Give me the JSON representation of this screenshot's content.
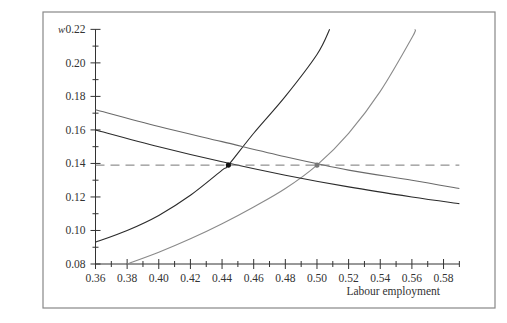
{
  "chart_data": {
    "type": "line",
    "title": "",
    "xlabel": "Labour employment",
    "ylabel": "w",
    "xlim": [
      0.36,
      0.59
    ],
    "ylim": [
      0.08,
      0.22
    ],
    "grid": false,
    "legend": null,
    "x_ticks": [
      "0.36",
      "0.38",
      "0.40",
      "0.42",
      "0.44",
      "0.46",
      "0.48",
      "0.50",
      "0.52",
      "0.54",
      "0.56",
      "0.58"
    ],
    "y_ticks": [
      "0.08",
      "0.10",
      "0.12",
      "0.14",
      "0.16",
      "0.18",
      "0.20",
      "0.22"
    ],
    "series": [
      {
        "name": "rising-curve-dark",
        "color": "#2b2b2b",
        "x": [
          0.36,
          0.38,
          0.4,
          0.42,
          0.44,
          0.444,
          0.46,
          0.48,
          0.5,
          0.508
        ],
        "y": [
          0.093,
          0.1,
          0.109,
          0.121,
          0.136,
          0.139,
          0.158,
          0.18,
          0.205,
          0.22
        ]
      },
      {
        "name": "rising-curve-light",
        "color": "#8a8a8a",
        "x": [
          0.38,
          0.4,
          0.42,
          0.44,
          0.46,
          0.48,
          0.5,
          0.52,
          0.54,
          0.56,
          0.562
        ],
        "y": [
          0.08,
          0.087,
          0.095,
          0.104,
          0.114,
          0.125,
          0.139,
          0.158,
          0.183,
          0.215,
          0.22
        ]
      },
      {
        "name": "falling-curve-dark",
        "color": "#2b2b2b",
        "x": [
          0.36,
          0.4,
          0.44,
          0.48,
          0.52,
          0.56,
          0.59
        ],
        "y": [
          0.16,
          0.15,
          0.141,
          0.133,
          0.126,
          0.12,
          0.116
        ]
      },
      {
        "name": "falling-curve-light",
        "color": "#6a6a6a",
        "x": [
          0.36,
          0.4,
          0.44,
          0.48,
          0.52,
          0.56,
          0.59
        ],
        "y": [
          0.172,
          0.162,
          0.153,
          0.144,
          0.136,
          0.13,
          0.125
        ]
      },
      {
        "name": "dashed-wage-level",
        "color": "#777777",
        "dashed": true,
        "x": [
          0.36,
          0.59
        ],
        "y": [
          0.139,
          0.139
        ]
      }
    ],
    "points": [
      {
        "name": "equilibrium-dark",
        "x": 0.444,
        "y": 0.139,
        "color": "#111111"
      },
      {
        "name": "equilibrium-gray",
        "x": 0.5,
        "y": 0.139,
        "color": "#777777"
      }
    ]
  }
}
